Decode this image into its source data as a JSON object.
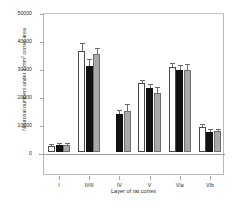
{
  "chart_data": {
    "type": "bar",
    "title": "",
    "xlabel": "Layer of rat cortex",
    "ylabel": "Neuronal numbers under 1 mm² cortex area",
    "ylabel_prefix": "Neuronal numbers under 1 mm",
    "ylabel_sup": "2",
    "ylabel_suffix": " cortex area",
    "categories": [
      "I",
      "II/III",
      "IV",
      "V",
      "VIa",
      "VIb"
    ],
    "ylim": [
      0,
      50000
    ],
    "yticks": [
      0,
      10000,
      20000,
      30000,
      40000,
      50000
    ],
    "ytick_labels": [
      "0",
      "10000",
      "20000",
      "30000",
      "40000",
      "50000"
    ],
    "grid": false,
    "legend": "none",
    "series": [
      {
        "name": "open",
        "style": "white-open-bar",
        "color": "#ffffff",
        "values": [
          2300,
          36000,
          0,
          24500,
          30500,
          8800
        ],
        "errors": [
          300,
          2400,
          0,
          700,
          1100,
          1000
        ]
      },
      {
        "name": "filled",
        "style": "black-filled-bar",
        "color": "#111111",
        "values": [
          2500,
          30700,
          13400,
          22800,
          29200,
          7300
        ],
        "errors": [
          250,
          2000,
          1300,
          1100,
          1400,
          500
        ]
      },
      {
        "name": "gray",
        "style": "gray-filled-bar",
        "color": "#a9a9a9",
        "values": [
          2600,
          35000,
          14700,
          21200,
          29200,
          7400
        ],
        "errors": [
          300,
          1800,
          2000,
          1500,
          1900,
          400
        ]
      }
    ]
  }
}
